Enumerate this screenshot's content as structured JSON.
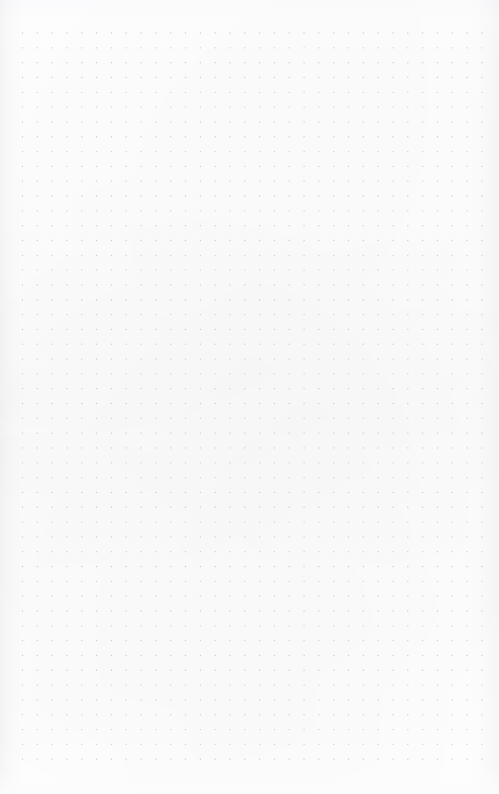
{
  "page": {
    "kind": "dot-grid-page",
    "width": 499,
    "height": 794,
    "background_color": "#fdfdfd",
    "text_content": "",
    "annotations": []
  },
  "grid": {
    "dot_color": "#c9c9cd",
    "dot_diameter_px": 1.3,
    "spacing_x_px": 14.82,
    "spacing_y_px": 14.82,
    "origin_x_px": 22.5,
    "origin_y_px": 33,
    "columns": 32,
    "rows": 50,
    "last_dot_x_px": 490,
    "last_dot_y_px": 768,
    "shape": "circle",
    "pattern": "square-lattice"
  },
  "margins": {
    "top_px": 33,
    "left_px": 22,
    "right_px": 9,
    "bottom_px": 26
  },
  "paper": {
    "texture": "subtle-mottle",
    "edge_shading_color": "#a0a0a5",
    "edge_shading_left_px": 26,
    "edge_shading_right_px": 30
  }
}
